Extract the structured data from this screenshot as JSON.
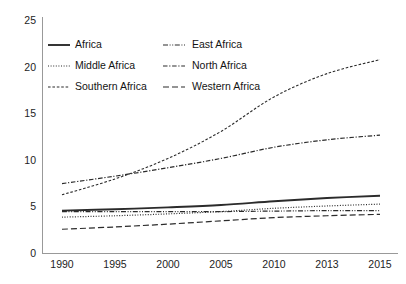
{
  "chart_data": {
    "type": "line",
    "title": "",
    "subtitle": "",
    "xlabel": "",
    "ylabel": "",
    "x": [
      "1990",
      "1995",
      "2000",
      "2005",
      "2010",
      "2013",
      "2015"
    ],
    "categories": [
      "1990",
      "1995",
      "2000",
      "2005",
      "2010",
      "2013",
      "2015"
    ],
    "xtick_labels": [
      "1990",
      "1995",
      "2000",
      "2005",
      "2010",
      "2013",
      "2015"
    ],
    "ytick_labels": [
      "0",
      "5",
      "10",
      "15",
      "20",
      "25"
    ],
    "ytick_values": [
      0,
      5,
      10,
      15,
      20,
      25
    ],
    "ylim": [
      0,
      25
    ],
    "grid": false,
    "legend_position": "upper-left-inside",
    "legend_columns": 2,
    "legend_frame": false,
    "series": [
      {
        "name": "Africa",
        "style": "solid",
        "color": "#2b2b2b",
        "dash": "none",
        "width": 1.9,
        "values": [
          4.6,
          4.75,
          4.95,
          5.2,
          5.6,
          5.95,
          6.2
        ]
      },
      {
        "name": "Middle Africa",
        "style": "dotted",
        "color": "#2b2b2b",
        "dash": "1,1.6",
        "width": 1.2,
        "values": [
          3.9,
          4.05,
          4.25,
          4.5,
          4.85,
          5.1,
          5.3
        ]
      },
      {
        "name": "Southern Africa",
        "style": "dashed",
        "color": "#2b2b2b",
        "dash": "2.6,1.8",
        "width": 1.1,
        "values": [
          6.3,
          8.0,
          10.2,
          13.1,
          16.8,
          19.3,
          20.8
        ]
      },
      {
        "name": "East Africa",
        "style": "dash-dot-dot",
        "color": "#2b2b2b",
        "dash": "5,1.6,1,1.6,1,1.6",
        "width": 1.2,
        "values": [
          4.5,
          4.5,
          4.5,
          4.5,
          4.55,
          4.6,
          4.6
        ]
      },
      {
        "name": "North Africa",
        "style": "dash-dot",
        "color": "#2b2b2b",
        "dash": "4.5,1.7,1.2,1.7",
        "width": 1.2,
        "values": [
          7.5,
          8.3,
          9.2,
          10.2,
          11.4,
          12.2,
          12.7
        ]
      },
      {
        "name": "Western Africa",
        "style": "long-dash",
        "color": "#2b2b2b",
        "dash": "6,3",
        "width": 1.2,
        "values": [
          2.6,
          2.85,
          3.15,
          3.5,
          3.85,
          4.05,
          4.2
        ]
      }
    ]
  },
  "legend": {
    "entries": [
      {
        "label": "Africa"
      },
      {
        "label": "East Africa"
      },
      {
        "label": "Middle Africa"
      },
      {
        "label": "North Africa"
      },
      {
        "label": "Southern Africa"
      },
      {
        "label": "Western Africa"
      }
    ]
  }
}
